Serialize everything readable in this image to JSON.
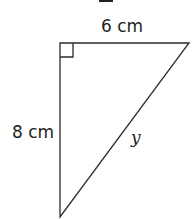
{
  "diagram": {
    "type": "right-triangle",
    "top_fragment": "‒",
    "labels": {
      "top_side": "6 cm",
      "left_side": "8 cm",
      "hypotenuse": "y"
    },
    "right_angle_marker": true
  }
}
